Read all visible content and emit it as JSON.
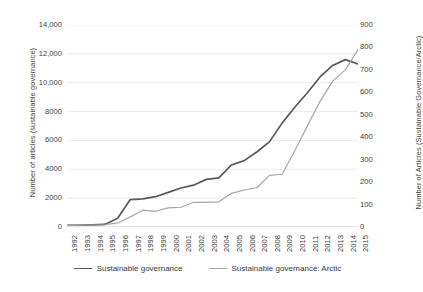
{
  "chart_data": {
    "type": "line",
    "title": "",
    "xlabel": "",
    "ylabel": "Number of articles (sustainable governance)",
    "y2label": "Number of Articles (Sustainable Governance/Arctic)",
    "grid": true,
    "legend_position": "bottom",
    "x": [
      1992,
      1993,
      1994,
      1995,
      1996,
      1997,
      1998,
      1999,
      2000,
      2001,
      2002,
      2003,
      2004,
      2005,
      2006,
      2007,
      2008,
      2009,
      2010,
      2011,
      2012,
      2013,
      2014,
      2015
    ],
    "xtick_labels": [
      "1992",
      "1993",
      "1994",
      "1995",
      "1996",
      "1997",
      "1998",
      "1999",
      "2000",
      "2001",
      "2002",
      "2003",
      "2004",
      "2005",
      "2006",
      "2007",
      "2008",
      "2009",
      "2010",
      "2011",
      "2012",
      "2013",
      "2014",
      "2015"
    ],
    "ylim": [
      0,
      14000
    ],
    "ytick_labels": [
      "0",
      "2000",
      "4000",
      "6000",
      "8000",
      "10,000",
      "12,000",
      "14,000"
    ],
    "ytick_values": [
      0,
      2000,
      4000,
      6000,
      8000,
      10000,
      12000,
      14000
    ],
    "y2lim": [
      0,
      900
    ],
    "y2tick_labels": [
      "0",
      "100",
      "200",
      "300",
      "400",
      "500",
      "600",
      "700",
      "800",
      "900"
    ],
    "y2tick_values": [
      0,
      100,
      200,
      300,
      400,
      500,
      600,
      700,
      800,
      900
    ],
    "series": [
      {
        "name": "Sustainable governance",
        "axis": "left",
        "color": "#595959",
        "values": [
          120,
          130,
          150,
          180,
          600,
          1900,
          1950,
          2100,
          2400,
          2700,
          2900,
          3300,
          3400,
          4300,
          4600,
          5200,
          5900,
          7200,
          8300,
          9300,
          10400,
          11200,
          11600,
          11300
        ]
      },
      {
        "name": "Sustainable governance: Arctic",
        "axis": "right",
        "color": "#a6a6a6",
        "values": [
          7,
          8,
          9,
          10,
          18,
          45,
          75,
          70,
          85,
          88,
          110,
          110,
          112,
          150,
          165,
          175,
          230,
          235,
          340,
          450,
          560,
          650,
          700,
          790
        ]
      }
    ]
  },
  "legend": {
    "items": [
      {
        "label": "Sustainable governance",
        "color": "#595959"
      },
      {
        "label": "Sustainable governance: Arctic",
        "color": "#a6a6a6"
      }
    ]
  }
}
